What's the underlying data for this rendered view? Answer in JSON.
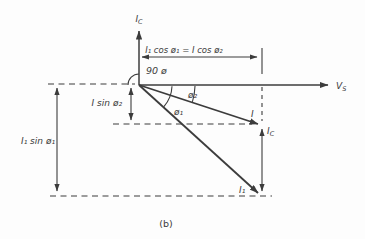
{
  "figure": {
    "caption": "(b)",
    "ink_color": "#3c3c3c",
    "background_color": "#fdfdfd",
    "axis": {
      "vertical_label": {
        "base": "I",
        "sub": "C"
      },
      "horizontal_label": {
        "base": "V",
        "sub": "S"
      }
    },
    "dimensions": {
      "top_label": "I₁ cos ø₁ = I cos ø₂",
      "left_outer_label": "I₁ sin ø₁",
      "left_inner_label": "I sin ø₂",
      "right_component_label": {
        "base": "I",
        "sub": "C"
      }
    },
    "angles": {
      "right_angle_label": "90 ø",
      "phi1_label": "ø₁",
      "phi2_label": "ø₂"
    },
    "vectors": {
      "i_label": "I",
      "i1_label": "I₁"
    }
  }
}
